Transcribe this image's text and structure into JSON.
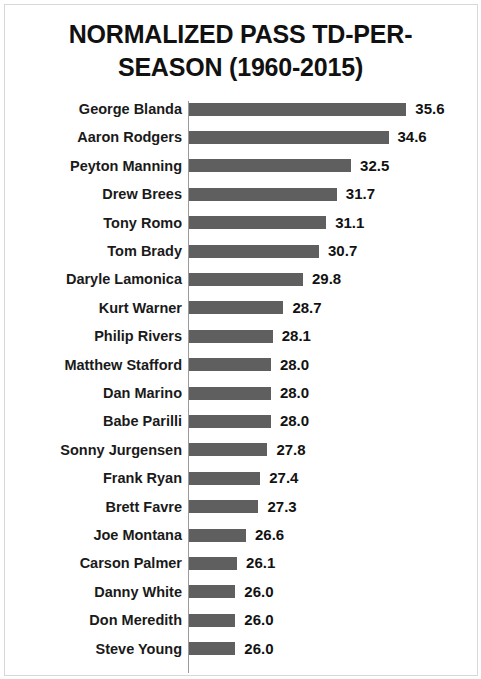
{
  "chart_data": {
    "type": "bar",
    "orientation": "horizontal",
    "title_line1": "NORMALIZED PASS TD-PER-",
    "title_line2": "SEASON (1960-2015)",
    "xlabel": "",
    "ylabel": "",
    "grid": false,
    "legend": "none",
    "axis_origin_value": 23.4,
    "axis_max_value": 36.2,
    "bar_color": "#5f5f5f",
    "categories": [
      "George Blanda",
      "Aaron Rodgers",
      "Peyton Manning",
      "Drew Brees",
      "Tony Romo",
      "Tom Brady",
      "Daryle Lamonica",
      "Kurt Warner",
      "Philip Rivers",
      "Matthew Stafford",
      "Dan Marino",
      "Babe Parilli",
      "Sonny Jurgensen",
      "Frank Ryan",
      "Brett Favre",
      "Joe Montana",
      "Carson Palmer",
      "Danny White",
      "Don Meredith",
      "Steve Young"
    ],
    "values": [
      35.6,
      34.6,
      32.5,
      31.7,
      31.1,
      30.7,
      29.8,
      28.7,
      28.1,
      28.0,
      28.0,
      28.0,
      27.8,
      27.4,
      27.3,
      26.6,
      26.1,
      26.0,
      26.0,
      26.0
    ],
    "value_labels": [
      "35.6",
      "34.6",
      "32.5",
      "31.7",
      "31.1",
      "30.7",
      "29.8",
      "28.7",
      "28.1",
      "28.0",
      "28.0",
      "28.0",
      "27.8",
      "27.4",
      "27.3",
      "26.6",
      "26.1",
      "26.0",
      "26.0",
      "26.0"
    ]
  }
}
